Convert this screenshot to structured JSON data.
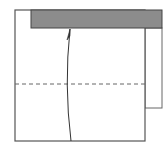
{
  "diagram": {
    "type": "origami-fold-step",
    "colors": {
      "paper_fill": "#ffffff",
      "outline": "#555555",
      "folded_flap_fill": "#8c8c8c",
      "fold_line": "#666666",
      "arrow": "#333333"
    },
    "elements": {
      "main_square": {
        "x": 15,
        "y": 10,
        "width": 130,
        "height": 131
      },
      "right_flap": {
        "x": 145,
        "y": 28,
        "width": 17,
        "height": 80
      },
      "gray_band": {
        "x": 31,
        "y": 10,
        "width": 131,
        "height": 18
      },
      "valley_fold_line": {
        "y": 84,
        "x1": 15,
        "x2": 145,
        "style": "dashed"
      },
      "fold_arrow": {
        "from": [
          71,
          141
        ],
        "to": [
          70,
          29
        ],
        "direction": "up"
      }
    }
  }
}
